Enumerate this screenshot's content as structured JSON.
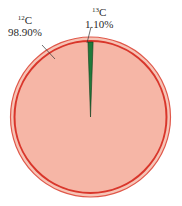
{
  "chart_data": {
    "type": "pie",
    "title": "",
    "categories": [
      "12C",
      "13C"
    ],
    "values": [
      98.9,
      1.1
    ],
    "labels": [
      {
        "isotope_mass": "12",
        "element": "C",
        "percent": "98.90%"
      },
      {
        "isotope_mass": "13",
        "element": "C",
        "percent": "1.10%"
      }
    ],
    "colors": [
      "#f6b6a6",
      "#1f7a3a"
    ],
    "ring_color": "#d9362b",
    "legend": "none",
    "grid": false,
    "start_angle_deg": -90,
    "direction": "counterclockwise-from-top for small slice ending at top"
  },
  "labels": {
    "c12": {
      "mass": "12",
      "symbol": "C",
      "percent": "98.90%"
    },
    "c13": {
      "mass": "13",
      "symbol": "C",
      "percent": "1.10%"
    }
  }
}
